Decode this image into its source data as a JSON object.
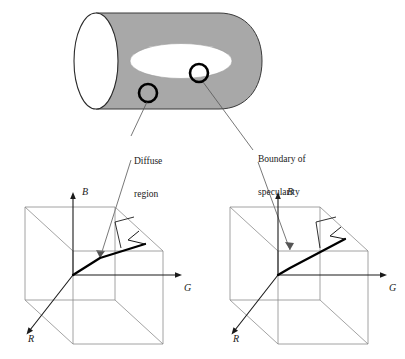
{
  "figure": {
    "type": "diagram",
    "background_color": "#ffffff"
  },
  "object": {
    "name": "cylinder",
    "body_color": "#a8a8a8",
    "outline_color": "#1a1a1a",
    "end_cap_color": "#ffffff",
    "highlight_color": "#ffffff",
    "highlight_name": "specular-highlight"
  },
  "markers": [
    {
      "name": "diffuse-region-marker",
      "cx": 148,
      "cy": 93,
      "r": 9,
      "color": "#000000"
    },
    {
      "name": "specularity-boundary-marker",
      "cx": 199,
      "cy": 73,
      "r": 9,
      "color": "#000000"
    }
  ],
  "callouts": [
    {
      "name": "diffuse-region-callout",
      "line1": "Diffuse",
      "line2": "region",
      "x": 134,
      "y": 134
    },
    {
      "name": "specularity-boundary-callout",
      "line1": "Boundary of",
      "line2": "specularity",
      "x": 258,
      "y": 132
    }
  ],
  "cubes": [
    {
      "name": "rgb-cube-diffuse",
      "offset_x": 0,
      "axes": [
        {
          "name": "b-axis",
          "label": "B",
          "label_x": 104,
          "label_y": 188
        },
        {
          "name": "g-axis",
          "label": "G",
          "label_x": 185,
          "label_y": 282
        },
        {
          "name": "r-axis",
          "label": "R",
          "label_x": 24,
          "label_y": 338
        }
      ],
      "signal_description": "diffuse color signal vector lying along the matte line"
    },
    {
      "name": "rgb-cube-specular",
      "offset_x": 205,
      "axes": [
        {
          "name": "b-axis",
          "label": "B",
          "label_x": 309,
          "label_y": 188
        },
        {
          "name": "g-axis",
          "label": "G",
          "label_x": 390,
          "label_y": 282
        },
        {
          "name": "r-axis",
          "label": "R",
          "label_x": 229,
          "label_y": 338
        }
      ],
      "signal_description": "color signal vector at boundary of specularity, displaced toward highlight"
    }
  ],
  "colors": {
    "cylinder_gray": "#a8a8a8",
    "wireframe_gray": "#8c8c8c",
    "ink": "#1a1a1a",
    "signal": "#000000"
  }
}
